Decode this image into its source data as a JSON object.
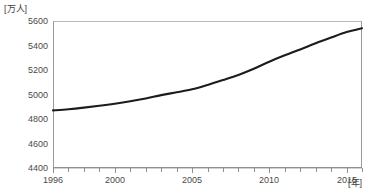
{
  "chart_data": {
    "type": "line",
    "title": "",
    "xlabel": "[年]",
    "ylabel": "[万人]",
    "x": [
      1996,
      1997,
      1998,
      1999,
      2000,
      2001,
      2002,
      2003,
      2004,
      2005,
      2006,
      2007,
      2008,
      2009,
      2010,
      2011,
      2012,
      2013,
      2014,
      2015,
      2016
    ],
    "values": [
      4870,
      4880,
      4893,
      4908,
      4925,
      4945,
      4968,
      4995,
      5018,
      5042,
      5078,
      5118,
      5160,
      5210,
      5268,
      5320,
      5368,
      5418,
      5465,
      5510,
      5540
    ],
    "series": [
      {
        "name": "",
        "values": [
          4870,
          4880,
          4893,
          4908,
          4925,
          4945,
          4968,
          4995,
          5018,
          5042,
          5078,
          5118,
          5160,
          5210,
          5268,
          5320,
          5368,
          5418,
          5465,
          5510,
          5540
        ]
      }
    ],
    "xlim": [
      1996,
      2016
    ],
    "ylim": [
      4400,
      5600
    ],
    "yticks": [
      5600,
      5400,
      5200,
      5000,
      4800,
      4600,
      4400
    ],
    "ytick_labels": [
      "5600",
      "5400",
      "5200",
      "5000",
      "4800",
      "4600",
      "4400"
    ],
    "xticks": [
      1996,
      1997,
      1998,
      1999,
      2000,
      2001,
      2002,
      2003,
      2004,
      2005,
      2006,
      2007,
      2008,
      2009,
      2010,
      2011,
      2012,
      2013,
      2014,
      2015,
      2016
    ],
    "xtick_labels_shown": [
      {
        "value": 1996,
        "label": "1996"
      },
      {
        "value": 2000,
        "label": "2000"
      },
      {
        "value": 2005,
        "label": "2005"
      },
      {
        "value": 2010,
        "label": "2010"
      },
      {
        "value": 2015,
        "label": "2015"
      }
    ],
    "grid": "horizontal",
    "legend": "none",
    "line_color": "#1c1c1c",
    "grid_color": "#d2d2d2",
    "axis_color": "#8f8f8f"
  },
  "labels": {
    "y_unit": "[万人]",
    "x_unit": "[年]"
  }
}
